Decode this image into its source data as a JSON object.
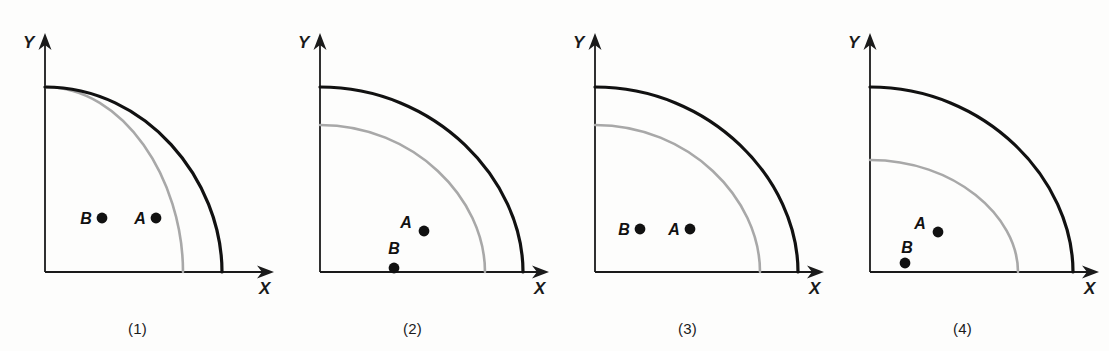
{
  "figure": {
    "background_color": "#fdfdfc",
    "axis_color": "#1a1a1a",
    "outer_curve_color": "#111111",
    "inner_curve_color": "#a8a8a8",
    "point_color": "#111111",
    "panel_width": 275,
    "panel_height": 351
  },
  "chart_data": {
    "type": "line",
    "title": "",
    "xlabel": "X",
    "ylabel": "Y",
    "axis_origin": {
      "x": 45,
      "y": 272
    },
    "series_names": [
      "outer curve",
      "inner curve"
    ],
    "panels": [
      {
        "caption": "(1)",
        "x_axis_label": "X",
        "y_axis_label": "Y",
        "outer_curve": {
          "color": "#111111",
          "y_intercept": 87,
          "x_intercept": 222
        },
        "inner_curve": {
          "color": "#a8a8a8",
          "y_intercept": 87,
          "x_intercept": 183
        },
        "points": [
          {
            "label": "B",
            "dot_x": 102,
            "dot_y": 218,
            "label_x": 86,
            "label_y": 224,
            "on_curve": false
          },
          {
            "label": "A",
            "dot_x": 156,
            "dot_y": 218,
            "label_x": 140,
            "label_y": 224,
            "on_curve": true
          }
        ]
      },
      {
        "caption": "(2)",
        "x_axis_label": "X",
        "y_axis_label": "Y",
        "outer_curve": {
          "color": "#111111",
          "y_intercept": 87,
          "x_intercept": 248
        },
        "inner_curve": {
          "color": "#a8a8a8",
          "y_intercept": 125,
          "x_intercept": 210
        },
        "points": [
          {
            "label": "A",
            "dot_x": 149,
            "dot_y": 231,
            "label_x": 131,
            "label_y": 228,
            "on_curve": true
          },
          {
            "label": "B",
            "dot_x": 119,
            "dot_y": 268,
            "label_x": 119,
            "label_y": 254,
            "on_curve": false
          }
        ]
      },
      {
        "caption": "(3)",
        "x_axis_label": "X",
        "y_axis_label": "Y",
        "outer_curve": {
          "color": "#111111",
          "y_intercept": 87,
          "x_intercept": 248
        },
        "inner_curve": {
          "color": "#a8a8a8",
          "y_intercept": 125,
          "x_intercept": 210
        },
        "points": [
          {
            "label": "B",
            "dot_x": 90,
            "dot_y": 229,
            "label_x": 74,
            "label_y": 235,
            "on_curve": false
          },
          {
            "label": "A",
            "dot_x": 140,
            "dot_y": 229,
            "label_x": 124,
            "label_y": 235,
            "on_curve": true
          }
        ]
      },
      {
        "caption": "(4)",
        "x_axis_label": "X",
        "y_axis_label": "Y",
        "outer_curve": {
          "color": "#111111",
          "y_intercept": 87,
          "x_intercept": 248
        },
        "inner_curve": {
          "color": "#a8a8a8",
          "y_intercept": 160,
          "x_intercept": 193
        },
        "points": [
          {
            "label": "A",
            "dot_x": 113,
            "dot_y": 232,
            "label_x": 95,
            "label_y": 229,
            "on_curve": true
          },
          {
            "label": "B",
            "dot_x": 80,
            "dot_y": 263,
            "label_x": 82,
            "label_y": 253,
            "on_curve": false
          }
        ]
      }
    ]
  }
}
